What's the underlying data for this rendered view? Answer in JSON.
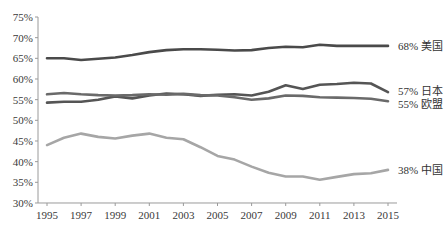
{
  "chart_data": {
    "type": "line",
    "title": "",
    "xlabel": "",
    "ylabel": "",
    "x": [
      1995,
      1996,
      1997,
      1998,
      1999,
      2000,
      2001,
      2002,
      2003,
      2004,
      2005,
      2006,
      2007,
      2008,
      2009,
      2010,
      2011,
      2012,
      2013,
      2014,
      2015
    ],
    "x_tick_labels": [
      "1995",
      "1997",
      "1999",
      "2001",
      "2003",
      "2005",
      "2007",
      "2009",
      "2011",
      "2013",
      "2015"
    ],
    "y_tick_labels": [
      "30%",
      "35%",
      "40%",
      "45%",
      "50%",
      "55%",
      "60%",
      "65%",
      "70%",
      "75%"
    ],
    "ylim": [
      30,
      75
    ],
    "xlim": [
      1995,
      2015
    ],
    "grid": false,
    "legend_position": "inline-right",
    "series": [
      {
        "name": "美国",
        "end_label": "68% 美国",
        "color": "#4a4a4a",
        "values": [
          65.0,
          65.0,
          64.6,
          64.9,
          65.2,
          65.8,
          66.5,
          67.0,
          67.2,
          67.2,
          67.1,
          66.9,
          67.0,
          67.5,
          67.8,
          67.7,
          68.3,
          68.0,
          68.0,
          68.0,
          68.0
        ]
      },
      {
        "name": "日本",
        "end_label": "57% 日本",
        "color": "#555555",
        "values": [
          54.3,
          54.5,
          54.5,
          55.0,
          55.8,
          55.3,
          56.0,
          56.5,
          56.3,
          55.9,
          56.2,
          56.3,
          56.0,
          56.9,
          58.5,
          57.6,
          58.6,
          58.8,
          59.1,
          58.9,
          56.8
        ]
      },
      {
        "name": "欧盟",
        "end_label": "55% 欧盟",
        "color": "#6a6a6a",
        "values": [
          56.3,
          56.6,
          56.3,
          56.1,
          56.0,
          56.1,
          56.3,
          56.2,
          56.4,
          56.1,
          56.0,
          55.6,
          55.0,
          55.3,
          56.0,
          55.9,
          55.6,
          55.5,
          55.4,
          55.2,
          54.6
        ]
      },
      {
        "name": "中国",
        "end_label": "38% 中国",
        "color": "#a6a6a6",
        "values": [
          44.0,
          45.8,
          46.8,
          46.0,
          45.6,
          46.3,
          46.8,
          45.8,
          45.4,
          43.5,
          41.4,
          40.5,
          38.8,
          37.3,
          36.4,
          36.4,
          35.6,
          36.3,
          37.0,
          37.2,
          38.0
        ]
      }
    ]
  },
  "layout": {
    "x_px_start": 47,
    "x_px_per_year": 17.05,
    "y_px_top": 17,
    "y_px_per_unit": 4.133,
    "axis_x_end": 397,
    "label_x": 398
  }
}
